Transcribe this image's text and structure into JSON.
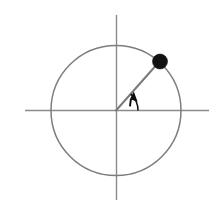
{
  "figure": {
    "background_color": "#ffffff",
    "width": 216,
    "height": 207,
    "caption": ""
  },
  "colors": {
    "axis": "#8a8a8a",
    "circle": "#7d7d7d",
    "radius": "#7a7a7a",
    "point": "#111111",
    "angle_marker": "#0d0d0d",
    "background": "#ffffff"
  },
  "chart_data": {
    "type": "scatter",
    "title": "",
    "subtitle": "",
    "xlabel": "",
    "ylabel": "",
    "xlim": [
      -1.45,
      1.45
    ],
    "ylim": [
      -1.45,
      1.45
    ],
    "grid": false,
    "legend": null,
    "axes": {
      "x_axis": {
        "visible": true,
        "x_start_px": 25,
        "x_end_px": 209,
        "y_px": 110,
        "ticks": [],
        "tick_labels": []
      },
      "y_axis": {
        "visible": true,
        "x_px": 116,
        "y_start_px": 15,
        "y_end_px": 200,
        "ticks": [],
        "tick_labels": []
      }
    },
    "shapes": [
      {
        "name": "unit-circle",
        "kind": "circle",
        "center_px": [
          116,
          110
        ],
        "center_units": [
          0,
          0
        ],
        "radius_px": 65,
        "radius_units": 1.0,
        "filled": false
      },
      {
        "name": "radius-segment",
        "kind": "line",
        "from_px": [
          116,
          110
        ],
        "to_px": [
          160,
          61
        ],
        "from_units": [
          0,
          0
        ],
        "to_units": [
          0.669,
          0.743
        ]
      },
      {
        "name": "angle-arc",
        "kind": "arc",
        "center_px": [
          116,
          110
        ],
        "radius_px": 22,
        "start_angle_deg": 0,
        "end_angle_deg": 48,
        "arrow_at": "end"
      }
    ],
    "points": [
      {
        "label": "",
        "x_units": 0.669,
        "y_units": 0.743,
        "x_px": 160,
        "y_px": 61,
        "marker": "filled-circle",
        "marker_radius_px": 7.5
      }
    ],
    "angle": {
      "value_deg": 48,
      "label": "",
      "vertex_px": [
        116,
        110
      ]
    },
    "annotations": []
  }
}
